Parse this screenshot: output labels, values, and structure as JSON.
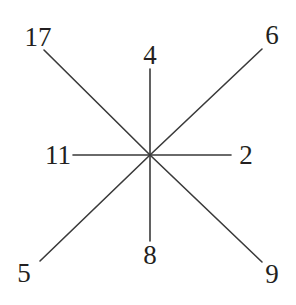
{
  "diagram": {
    "type": "star-graph",
    "center": {
      "x": 150,
      "y": 155
    },
    "background_color": "#ffffff",
    "line_color": "#3a3a3a",
    "label_color": "#231f20",
    "ray_count": 8,
    "nodes": [
      {
        "id": "nw",
        "label": "17",
        "direction": "north-west",
        "label_x": 38,
        "label_y": 37,
        "line_x": 44,
        "line_y": 50
      },
      {
        "id": "n",
        "label": "4",
        "direction": "north",
        "label_x": 150,
        "label_y": 55,
        "line_x": 150,
        "line_y": 69
      },
      {
        "id": "ne",
        "label": "6",
        "direction": "north-east",
        "label_x": 272,
        "label_y": 35,
        "line_x": 262,
        "line_y": 49
      },
      {
        "id": "w",
        "label": "11",
        "direction": "west",
        "label_x": 58,
        "label_y": 155,
        "line_x": 73,
        "line_y": 155
      },
      {
        "id": "e",
        "label": "2",
        "direction": "east",
        "label_x": 246,
        "label_y": 155,
        "line_x": 231,
        "line_y": 155
      },
      {
        "id": "sw",
        "label": "5",
        "direction": "south-west",
        "label_x": 24,
        "label_y": 273,
        "line_x": 40,
        "line_y": 261
      },
      {
        "id": "s",
        "label": "8",
        "direction": "south",
        "label_x": 150,
        "label_y": 255,
        "line_x": 150,
        "line_y": 241
      },
      {
        "id": "se",
        "label": "9",
        "direction": "south-east",
        "label_x": 272,
        "label_y": 274,
        "line_x": 262,
        "line_y": 262
      }
    ]
  }
}
